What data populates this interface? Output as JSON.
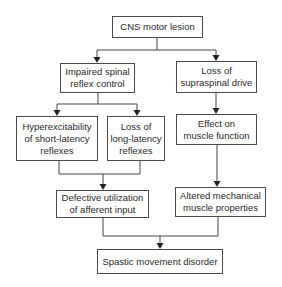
{
  "diagram": {
    "type": "flowchart",
    "nodes": {
      "cns": "CNS motor lesion",
      "impaired": "Impaired spinal\nreflex control",
      "loss_supraspinal": "Loss of\nsupraspinal drive",
      "hyper": "Hyperexcitability\nof short-latency\nreflexes",
      "loss_long": "Loss of\nlong-latency\nreflexes",
      "effect": "Effect on\nmuscle function",
      "defective": "Defective utilization\nof afferent input",
      "altered": "Altered mechanical\nmuscle properties",
      "spastic": "Spastic movement disorder"
    },
    "edges": [
      [
        "cns",
        "impaired"
      ],
      [
        "cns",
        "loss_supraspinal"
      ],
      [
        "impaired",
        "hyper"
      ],
      [
        "impaired",
        "loss_long"
      ],
      [
        "loss_supraspinal",
        "effect"
      ],
      [
        "hyper",
        "defective"
      ],
      [
        "loss_long",
        "defective"
      ],
      [
        "effect",
        "altered"
      ],
      [
        "defective",
        "spastic"
      ],
      [
        "altered",
        "spastic"
      ]
    ]
  }
}
